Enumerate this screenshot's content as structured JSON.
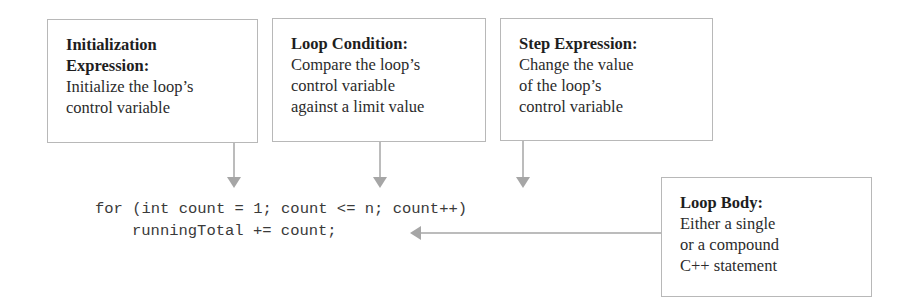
{
  "callouts": {
    "initialization": {
      "title": "Initialization\nExpression:",
      "title_line1": "Initialization",
      "title_line2": "Expression:",
      "description": "Initialize the loop’s\ncontrol variable"
    },
    "condition": {
      "title": "Loop Condition:",
      "description": "Compare the loop’s\ncontrol variable\nagainst a limit value"
    },
    "step": {
      "title": "Step Expression:",
      "description": "Change the value\nof the loop’s\ncontrol variable"
    },
    "body": {
      "title": "Loop Body:",
      "description": "Either a single\nor a compound\nC++ statement"
    }
  },
  "code": {
    "line1": "for (int count = 1; count <= n; count++)",
    "line2": "runningTotal += count;"
  },
  "colors": {
    "arrow": "#a6a6a6",
    "box_border": "#b8b8b8",
    "text": "#2b2b2b"
  }
}
